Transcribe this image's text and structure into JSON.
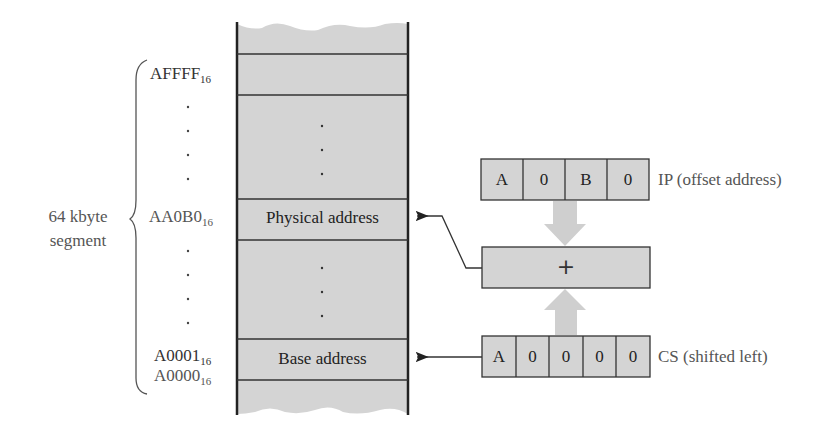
{
  "segment_label": {
    "line1": "64 kbyte",
    "line2": "segment"
  },
  "addresses": {
    "top": {
      "value": "AFFFF",
      "base": "16"
    },
    "physical": {
      "value": "AA0B0",
      "base": "16"
    },
    "base_plus_one": {
      "value": "A0001",
      "base": "16"
    },
    "base": {
      "value": "A0000",
      "base": "16"
    },
    "ellipsis": "."
  },
  "memory_cells": {
    "physical_label": "Physical address",
    "base_label": "Base address"
  },
  "ip_register": {
    "digits": [
      "A",
      "0",
      "B",
      "0"
    ],
    "label": "IP (offset address)"
  },
  "adder": {
    "symbol": "+"
  },
  "cs_register": {
    "digits": [
      "A",
      "0",
      "0",
      "0",
      "0"
    ],
    "label": "CS (shifted left)"
  },
  "colors": {
    "fill": "#d4d4d4",
    "line": "#2a2a2a",
    "arrow_fill": "#cfcfcf"
  }
}
